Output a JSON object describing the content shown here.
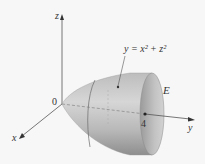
{
  "figure": {
    "type": "3d-solid-region",
    "axes": {
      "x_label": "x",
      "y_label": "y",
      "z_label": "z",
      "origin_label": "0"
    },
    "surface_equation": "y = x² + z²",
    "region_label": "E",
    "marked_point_label": "4",
    "colors": {
      "background": "#f7f7f7",
      "surface_light": "#d4d4d4",
      "surface_dark": "#8f8f8f",
      "cap": "#b5b5b5",
      "axis": "#555555",
      "text": "#333333"
    }
  }
}
